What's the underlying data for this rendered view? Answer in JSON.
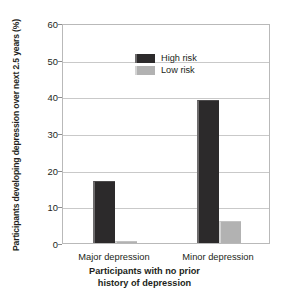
{
  "chart_data": {
    "type": "bar",
    "title": "",
    "xlabel": "Participants with no prior history of depression",
    "xlabel_lines": [
      "Participants with no prior",
      "history of depression"
    ],
    "ylabel": "Participants developing depression over next 2.5 years (%)",
    "categories": [
      "Major depression",
      "Minor depression"
    ],
    "series": [
      {
        "name": "High risk",
        "color": "#2c2a2b",
        "values": [
          17,
          39
        ]
      },
      {
        "name": "Low risk",
        "color": "#b2b2b2",
        "values": [
          0.5,
          6
        ]
      }
    ],
    "ylim": [
      0,
      60
    ],
    "yticks": [
      0,
      10,
      20,
      30,
      40,
      50,
      60
    ],
    "ytick_labels": [
      "0",
      "10",
      "20",
      "30",
      "40",
      "50",
      "60"
    ],
    "grid": true,
    "legend_position": "top-left"
  },
  "legend": {
    "items": [
      {
        "label": "High risk",
        "swatch": "dark-swatch-icon"
      },
      {
        "label": "Low risk",
        "swatch": "light-swatch-icon"
      }
    ]
  }
}
